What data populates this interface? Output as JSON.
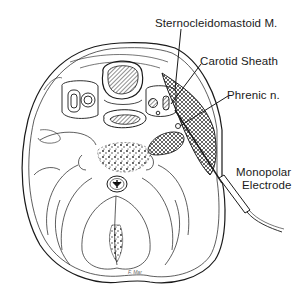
{
  "diagram": {
    "labels": {
      "sternocleidomastoid": "Sternocleidomastoid M.",
      "carotid_sheath": "Carotid Sheath",
      "phrenic_nerve": "Phrenic n.",
      "electrode_line1": "Monopolar",
      "electrode_line2": "Electrode"
    },
    "signature": "F. Mar",
    "colors": {
      "ink": "#1a1a1a",
      "background": "#ffffff"
    }
  }
}
